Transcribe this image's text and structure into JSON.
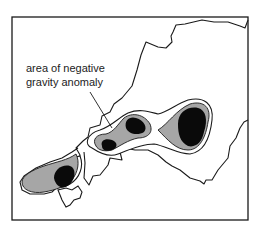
{
  "map": {
    "annotation": {
      "line1": "area of negative",
      "line2": "gravity anomaly"
    },
    "legend_shading": {
      "outer_contour": "#ffffff",
      "middle_zone": "#a6a6a6",
      "core": "#0a0a0a"
    },
    "colors": {
      "frame": "#1a1a1a",
      "coastline": "#1a1a1a",
      "land": "#ffffff",
      "sea": "#ffffff"
    }
  }
}
